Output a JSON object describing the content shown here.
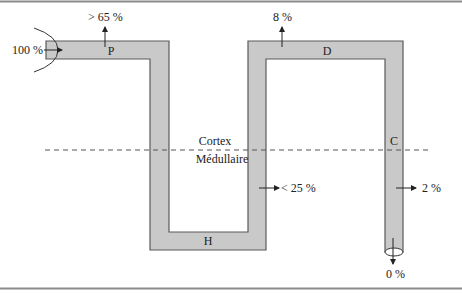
{
  "colors": {
    "tube_fill": "#c9c9c9",
    "tube_stroke": "#5a5a5a",
    "text": "#222222",
    "frame": "#8a8a8a",
    "dash": "#555555"
  },
  "segments": {
    "P": "P",
    "H": "H",
    "D": "D",
    "C": "C"
  },
  "zones": {
    "cortex": "Cortex",
    "medulla": "Médullaire"
  },
  "flows": {
    "inflow": "100 %",
    "proximal": "> 65 %",
    "loop": "< 25 %",
    "distal": "8 %",
    "collecting": "2 %",
    "outflow": "0 %"
  }
}
